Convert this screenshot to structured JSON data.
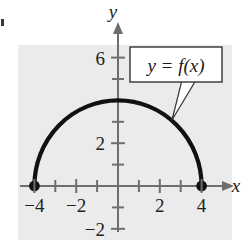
{
  "figure": {
    "name": "graph-of-semicircle-function",
    "background_color": "#ebebeb",
    "page_color": "#ffffff",
    "curve_color": "#111111",
    "axis_color": "#6e6e6e",
    "callout_fill": "#ffffff",
    "callout_border": "#333333"
  },
  "axes": {
    "x_label": "x",
    "y_label": "y",
    "x_tick_labels": [
      {
        "value": -4,
        "text": "−4"
      },
      {
        "value": -2,
        "text": "−2"
      },
      {
        "value": 2,
        "text": "2"
      },
      {
        "value": 4,
        "text": "4"
      }
    ],
    "y_tick_labels": [
      {
        "value": 6,
        "text": "6"
      },
      {
        "value": 2,
        "text": "2"
      },
      {
        "value": -2,
        "text": "−2"
      }
    ]
  },
  "callout": {
    "text": "y = f(x)"
  },
  "chart_data": {
    "type": "line",
    "title": "",
    "xlabel": "x",
    "ylabel": "y",
    "xlim": [
      -5,
      5
    ],
    "ylim": [
      -2.6,
      7
    ],
    "grid": false,
    "legend": "none",
    "annotations": [
      {
        "text": "y = f(x)",
        "x": 2.3,
        "y": 5.4,
        "points_to": {
          "x": 1.9,
          "y": 3.5
        }
      }
    ],
    "series": [
      {
        "name": "f(x) = sqrt(16 - x^2)",
        "description": "upper semicircle of radius 4 centered at the origin",
        "x": [
          -4,
          -3.5,
          -3,
          -2.5,
          -2,
          -1.5,
          -1,
          -0.5,
          0,
          0.5,
          1,
          1.5,
          2,
          2.5,
          3,
          3.5,
          4
        ],
        "y": [
          0,
          1.94,
          2.65,
          3.12,
          3.46,
          3.71,
          3.87,
          3.97,
          4,
          3.97,
          3.87,
          3.71,
          3.46,
          3.12,
          2.65,
          1.94,
          0
        ]
      }
    ],
    "markers": [
      {
        "type": "filled-dot",
        "x": -4,
        "y": 0
      },
      {
        "type": "filled-dot",
        "x": 4,
        "y": 0
      }
    ]
  }
}
